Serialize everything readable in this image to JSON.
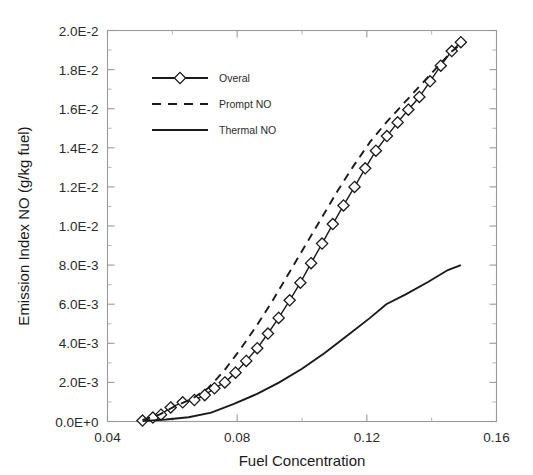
{
  "chart_data": {
    "type": "line",
    "title": "",
    "xlabel": "Fuel Concentration",
    "ylabel": "Emission Index NO (g/kg fuel)",
    "xlim": [
      0.04,
      0.16
    ],
    "ylim": [
      0.0,
      0.02
    ],
    "xticks": [
      0.04,
      0.08,
      0.12,
      0.16
    ],
    "xtick_labels": [
      "0.04",
      "0.08",
      "0.12",
      "0.16"
    ],
    "yticks": [
      0.0,
      0.002,
      0.004,
      0.006,
      0.008,
      0.01,
      0.012,
      0.014,
      0.016,
      0.018,
      0.02
    ],
    "ytick_labels": [
      "0.0E+0",
      "2.0E-3",
      "4.0E-3",
      "6.0E-3",
      "8.0E-3",
      "1.0E-2",
      "1.2E-2",
      "1.4E-2",
      "1.6E-2",
      "1.8E-2",
      "2.0E-2"
    ],
    "grid": false,
    "minor_ticks": true,
    "legend_position": "upper-left-inside",
    "series": [
      {
        "name": "Overal",
        "style": "solid-with-diamond-markers",
        "marker": "diamond-open",
        "color": "#1a1a1a",
        "x": [
          0.0508,
          0.054,
          0.0565,
          0.0595,
          0.0632,
          0.0668,
          0.07,
          0.073,
          0.0762,
          0.0795,
          0.0828,
          0.0862,
          0.0895,
          0.0928,
          0.0962,
          0.0995,
          0.1028,
          0.1062,
          0.1095,
          0.1128,
          0.1162,
          0.1195,
          0.1228,
          0.1262,
          0.1295,
          0.1328,
          0.1362,
          0.1395,
          0.1428,
          0.1462,
          0.149
        ],
        "y": [
          5e-05,
          0.0002,
          0.00035,
          0.00072,
          0.00098,
          0.0011,
          0.00135,
          0.0017,
          0.002,
          0.0025,
          0.0031,
          0.00375,
          0.0045,
          0.0053,
          0.0062,
          0.0071,
          0.0081,
          0.0091,
          0.0101,
          0.01105,
          0.012,
          0.01295,
          0.01385,
          0.0146,
          0.0153,
          0.01595,
          0.0166,
          0.0174,
          0.0182,
          0.01895,
          0.0194
        ]
      },
      {
        "name": "Prompt NO",
        "style": "dashed",
        "marker": "none",
        "color": "#1a1a1a",
        "x": [
          0.0508,
          0.056,
          0.061,
          0.066,
          0.071,
          0.076,
          0.081,
          0.086,
          0.091,
          0.096,
          0.101,
          0.106,
          0.111,
          0.116,
          0.121,
          0.126,
          0.131,
          0.136,
          0.141,
          0.146,
          0.149
        ],
        "y": [
          8e-05,
          0.00035,
          0.0008,
          0.00115,
          0.0017,
          0.0026,
          0.0037,
          0.0049,
          0.0062,
          0.0076,
          0.009,
          0.0104,
          0.0118,
          0.0131,
          0.0143,
          0.0153,
          0.0162,
          0.0171,
          0.018,
          0.0189,
          0.0193
        ]
      },
      {
        "name": "Thermal NO",
        "style": "solid",
        "marker": "none",
        "color": "#1a1a1a",
        "x": [
          0.0508,
          0.058,
          0.065,
          0.072,
          0.079,
          0.086,
          0.093,
          0.1,
          0.107,
          0.114,
          0.121,
          0.126,
          0.132,
          0.139,
          0.145,
          0.149
        ],
        "y": [
          2e-05,
          0.0001,
          0.00022,
          0.00045,
          0.0009,
          0.0014,
          0.002,
          0.0027,
          0.0035,
          0.0044,
          0.0053,
          0.006,
          0.0065,
          0.00715,
          0.00775,
          0.008
        ]
      }
    ],
    "legend_entries": [
      {
        "label": "Overal",
        "style": "solid-with-diamond-markers"
      },
      {
        "label": "Prompt NO",
        "style": "dashed"
      },
      {
        "label": "Thermal NO",
        "style": "solid"
      }
    ]
  }
}
